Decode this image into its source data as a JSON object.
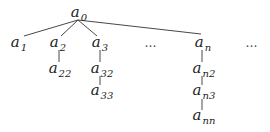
{
  "diagram": {
    "type": "tree",
    "root": {
      "id": "a0",
      "base": "a",
      "sub": "0",
      "x": 79,
      "y": 14
    },
    "nodes": [
      {
        "id": "a1",
        "base": "a",
        "sub": "1",
        "x": 19,
        "y": 44
      },
      {
        "id": "a2",
        "base": "a",
        "sub": "2",
        "x": 58,
        "y": 44
      },
      {
        "id": "a3",
        "base": "a",
        "sub": "3",
        "x": 100,
        "y": 44
      },
      {
        "id": "an",
        "base": "a",
        "sub": "n",
        "x": 203,
        "y": 44
      },
      {
        "id": "a22",
        "base": "a",
        "sub": "22",
        "x": 58,
        "y": 70
      },
      {
        "id": "a32",
        "base": "a",
        "sub": "32",
        "x": 100,
        "y": 70
      },
      {
        "id": "a33",
        "base": "a",
        "sub": "33",
        "x": 100,
        "y": 92
      },
      {
        "id": "an2",
        "base": "a",
        "sub": "n2",
        "x": 203,
        "y": 70
      },
      {
        "id": "an3",
        "base": "a",
        "sub": "n3",
        "x": 203,
        "y": 92
      },
      {
        "id": "ann",
        "base": "a",
        "sub": "nn",
        "x": 203,
        "y": 117
      }
    ],
    "ellipses": [
      {
        "text": "…",
        "x": 151,
        "y": 43
      },
      {
        "text": "…",
        "x": 252,
        "y": 43
      }
    ],
    "edges": [
      {
        "from": "a0",
        "to": "a1"
      },
      {
        "from": "a0",
        "to": "a2"
      },
      {
        "from": "a0",
        "to": "a3"
      },
      {
        "from": "a0",
        "to": "an"
      },
      {
        "from": "a2",
        "to": "a22"
      },
      {
        "from": "a3",
        "to": "a32"
      },
      {
        "from": "a32",
        "to": "a33"
      },
      {
        "from": "an",
        "to": "an2"
      },
      {
        "from": "an2",
        "to": "an3"
      },
      {
        "from": "an3",
        "to": "ann"
      }
    ]
  }
}
